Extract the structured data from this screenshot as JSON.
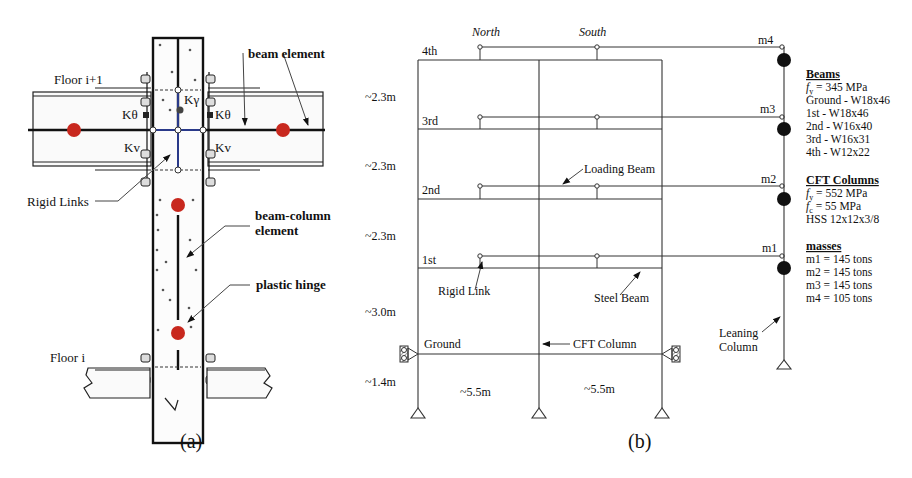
{
  "panel_a": {
    "caption": "(a)",
    "labels": {
      "floor_top": "Floor i+1",
      "floor_bottom": "Floor i",
      "beam_element": "beam element",
      "k_theta_left": "Kθ",
      "k_theta_right": "Kθ",
      "k_gamma": "Kγ",
      "kv_left": "Kv",
      "kv_right": "Kv",
      "rigid_links": "Rigid Links",
      "beam_column_1": "beam-column",
      "beam_column_2": "element",
      "plastic_hinge": "plastic hinge"
    },
    "colors": {
      "hinge": "#c8281e",
      "rigid_link": "#2a3a8a"
    }
  },
  "panel_b": {
    "caption": "(b)",
    "top_labels": {
      "north": "North",
      "south": "South"
    },
    "floors": [
      "4th",
      "3rd",
      "2nd",
      "1st",
      "Ground"
    ],
    "heights": [
      "~2.3m",
      "~2.3m",
      "~2.3m",
      "~3.0m",
      "~1.4m"
    ],
    "spans": [
      "~5.5m",
      "~5.5m"
    ],
    "masses_labels": [
      "m4",
      "m3",
      "m2",
      "m1"
    ],
    "annotations": {
      "loading_beam": "Loading Beam",
      "rigid_link": "Rigid Link",
      "steel_beam": "Steel Beam",
      "cft_column": "CFT Column",
      "leaning_1": "Leaning",
      "leaning_2": "Column"
    },
    "beams": {
      "title": "Beams",
      "fy": "= 345 MPa",
      "rows": [
        "Ground - W18x46",
        "1st - W18x46",
        "2nd - W16x40",
        "3rd - W16x31",
        "4th - W12x22"
      ]
    },
    "cft_columns": {
      "title": "CFT Columns",
      "fy": "= 552 MPa",
      "fc": "= 55 MPa",
      "section": "HSS 12x12x3/8"
    },
    "masses": {
      "title": "masses",
      "rows": [
        "m1 = 145 tons",
        "m2 = 145 tons",
        "m3 = 145 tons",
        "m4 = 105 tons"
      ]
    }
  }
}
